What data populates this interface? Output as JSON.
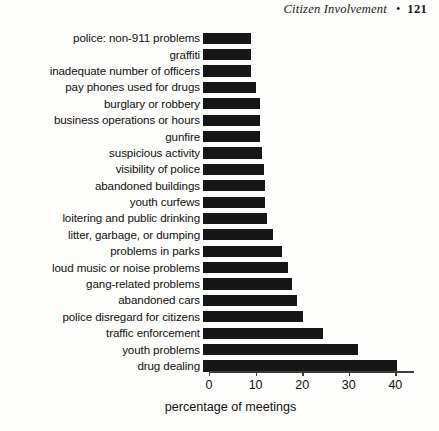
{
  "running_head": {
    "title": "Citizen Involvement",
    "separator": "•",
    "page_number": "121"
  },
  "chart_data": {
    "type": "bar",
    "orientation": "horizontal",
    "title": "",
    "subtitle": "",
    "xlabel": "percentage of meetings",
    "ylabel": "",
    "xlim": [
      0,
      44
    ],
    "xticks": [
      0,
      10,
      20,
      30,
      40
    ],
    "xtick_labels": [
      "0",
      "10",
      "20",
      "30",
      "40"
    ],
    "grid": false,
    "legend": null,
    "bar_color": "#161616",
    "axis_color": "#3c3c3c",
    "categories": [
      "police: non-911 problems",
      "graffiti",
      "inadequate number of officers",
      "pay phones used for drugs",
      "burglary or robbery",
      "business operations or hours",
      "gunfire",
      "suspicious activity",
      "visibility of police",
      "abandoned buildings",
      "youth curfews",
      "loitering and public drinking",
      "litter, garbage, or dumping",
      "problems in parks",
      "loud music or noise problems",
      "gang-related problems",
      "abandoned cars",
      "police disregard for citizens",
      "traffic enforcement",
      "youth problems",
      "drug dealing"
    ],
    "values": [
      10.4,
      10.4,
      10.4,
      11.4,
      12.2,
      12.2,
      12.2,
      12.6,
      13.0,
      13.4,
      13.4,
      13.8,
      15.0,
      17.0,
      18.2,
      19.2,
      20.2,
      21.4,
      25.8,
      33.2,
      41.6
    ]
  }
}
